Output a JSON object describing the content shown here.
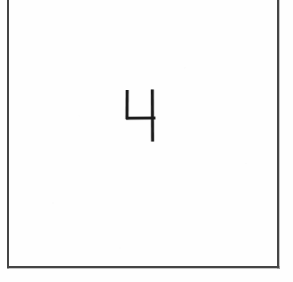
{
  "document": {
    "kind": "scanned-form-field",
    "title": "Handwritten Digit Field",
    "canvas": {
      "width": 293,
      "height": 282
    },
    "background_color": "#fefefe"
  },
  "digit_box": {
    "name": "digit-bounding-box",
    "border_color": "#3b3b3b",
    "border_width_px": 1.6,
    "fill_color": "transparent",
    "left_px": 7,
    "right_px": 279,
    "bottom_px": 268,
    "top_px": -6,
    "top_edge_visible": false,
    "note": "Top edge of the cell is cropped above the image boundary."
  },
  "handwriting": {
    "name": "handwritten-digit",
    "character": "4",
    "label": "4",
    "ink_color": "#1b1b1b",
    "stroke_width_px": 2.6,
    "style": "open-top three-stroke printed numeral",
    "bbox": {
      "x": 126,
      "y": 89,
      "width": 29,
      "height": 53
    },
    "strokes": [
      {
        "name": "left-vertical-stroke",
        "points": [
          [
            127.2,
            90.0
          ],
          [
            127.0,
            119.2
          ]
        ]
      },
      {
        "name": "horizontal-crossbar-stroke",
        "points": [
          [
            126.2,
            118.2
          ],
          [
            155.4,
            118.0
          ]
        ]
      },
      {
        "name": "right-vertical-descender-stroke",
        "points": [
          [
            152.3,
            89.6
          ],
          [
            152.6,
            141.6
          ]
        ]
      }
    ]
  }
}
